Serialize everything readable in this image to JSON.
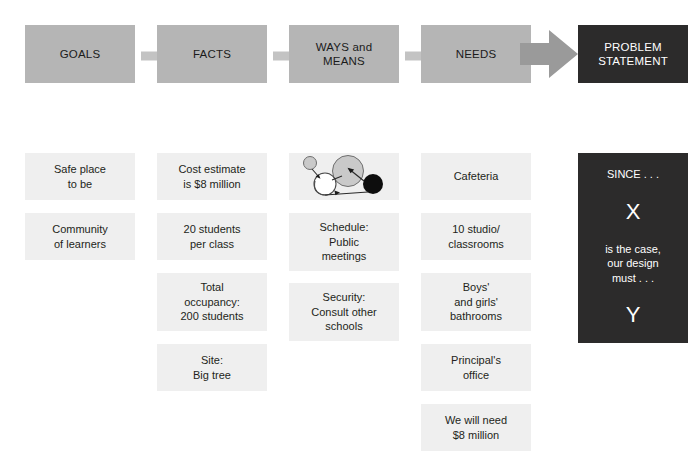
{
  "diagram": {
    "colors": {
      "header_gray": "#b5b5b5",
      "card_gray": "#efefef",
      "dark": "#2c2b2b",
      "text": "#231f20",
      "text_light": "#ffffff",
      "arrow_gray": "#c3c3c3",
      "arrow_gray_large": "#9a9a9a",
      "page_background": "#ffffff"
    },
    "columns": [
      {
        "id": "goals",
        "header": "GOALS",
        "header_style": "gray",
        "items": [
          {
            "text": "Safe place\nto be",
            "lines": 2
          },
          {
            "text": "Community\nof learners",
            "lines": 2
          }
        ]
      },
      {
        "id": "facts",
        "header": "FACTS",
        "header_style": "gray",
        "items": [
          {
            "text": "Cost estimate\nis $8 million",
            "lines": 2
          },
          {
            "text": "20 students\nper class",
            "lines": 2
          },
          {
            "text": "Total\noccupancy:\n200 students",
            "lines": 3
          },
          {
            "text": "Site:\nBig tree",
            "lines": 2
          }
        ]
      },
      {
        "id": "ways-and-means",
        "header": "WAYS and\nMEANS",
        "header_style": "gray",
        "items": [
          {
            "text": "",
            "lines": 2,
            "illustration": "circles-and-arrows-diagram"
          },
          {
            "text": "Schedule:\nPublic\nmeetings",
            "lines": 3
          },
          {
            "text": "Security:\nConsult other\nschools",
            "lines": 3
          }
        ]
      },
      {
        "id": "needs",
        "header": "NEEDS",
        "header_style": "gray",
        "items": [
          {
            "text": "Cafeteria",
            "lines": 1
          },
          {
            "text": "10 studio/\nclassrooms",
            "lines": 2
          },
          {
            "text": "Boys'\nand girls'\nbathrooms",
            "lines": 3
          },
          {
            "text": "Principal's\noffice",
            "lines": 2
          },
          {
            "text": "We will need\n$8 million",
            "lines": 2
          }
        ]
      },
      {
        "id": "problem-statement",
        "header": "PROBLEM\nSTATEMENT",
        "header_style": "dark",
        "panel": {
          "since_label": "SINCE . . .",
          "variable_x": "X",
          "body": "is the case,\nour design\nmust . . .",
          "variable_y": "Y"
        }
      }
    ],
    "arrows": [
      {
        "id": "arrow-goals-to-facts",
        "size": "small"
      },
      {
        "id": "arrow-facts-to-ways",
        "size": "small"
      },
      {
        "id": "arrow-ways-to-needs",
        "size": "small"
      },
      {
        "id": "arrow-needs-to-problem",
        "size": "large"
      }
    ]
  }
}
